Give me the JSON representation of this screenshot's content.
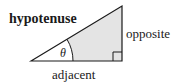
{
  "diagram": {
    "labels": {
      "hypotenuse": "hypotenuse",
      "opposite": "opposite",
      "adjacent": "adjacent",
      "angle": "θ"
    },
    "colors": {
      "stroke": "#1a1a1a",
      "shade": "#e4e4e4",
      "background": "#ffffff"
    },
    "vertices": {
      "angle_vertex": [
        31,
        61
      ],
      "top_vertex": [
        122,
        6
      ],
      "right_angle_vertex": [
        122,
        61
      ]
    },
    "arc_radius": 42,
    "right_angle_marker_size": 9
  }
}
